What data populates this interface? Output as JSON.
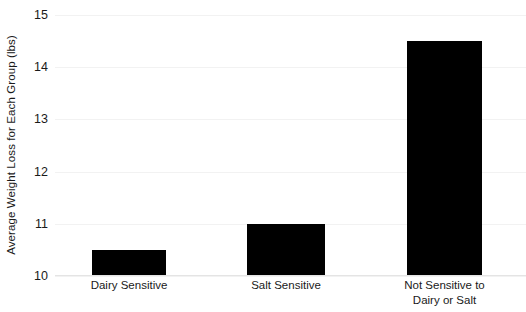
{
  "chart_data": {
    "type": "bar",
    "title": "",
    "xlabel": "",
    "ylabel": "Average Weight Loss for Each Group (lbs)",
    "categories": [
      "Dairy Sensitive",
      "Salt Sensitive",
      "Not Sensitive to Dairy or Salt"
    ],
    "category_lines": [
      [
        "Dairy Sensitive"
      ],
      [
        "Salt Sensitive"
      ],
      [
        "Not Sensitive to",
        "Dairy or Salt"
      ]
    ],
    "values": [
      10.5,
      11.0,
      14.5
    ],
    "ylim": [
      10,
      15
    ],
    "yticks": [
      10,
      11,
      12,
      13,
      14,
      15
    ],
    "ytick_labels": [
      "10",
      "11",
      "12",
      "13",
      "14",
      "15"
    ],
    "grid": true,
    "legend": "none",
    "bar_color": "#000000",
    "grid_color": "#f2f2f2",
    "axis_color": "#e4e4e4",
    "text_color": "#1a1a1a"
  }
}
